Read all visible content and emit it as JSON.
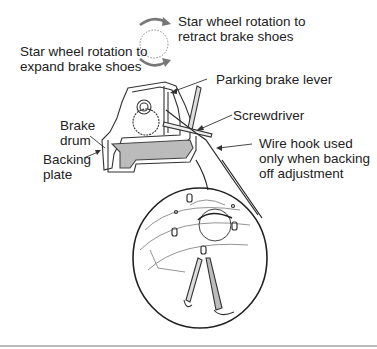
{
  "diagram": {
    "labels": {
      "retract": [
        "Star wheel rotation to",
        "retract brake shoes"
      ],
      "expand": [
        "Star wheel rotation to",
        "expand brake shoes"
      ],
      "parking_lever": "Parking brake lever",
      "screwdriver": "Screwdriver",
      "brake_drum": [
        "Brake",
        "drum"
      ],
      "backing_plate": [
        "Backing",
        "plate"
      ],
      "wire_hook": [
        "Wire hook used",
        "only when backing",
        "off adjustment"
      ]
    }
  }
}
